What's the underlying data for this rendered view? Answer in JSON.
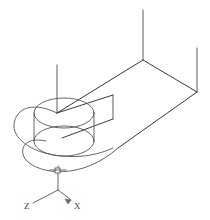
{
  "drawing": {
    "title": "Isometric Wireframe Part",
    "background_color": "#ffffff",
    "line_color": "#4a4a4a",
    "view": "isometric",
    "description": "3D isometric wireframe of a flat plate with a rounded end containing a through hole, with vertical construction lines"
  },
  "axis_indicator": {
    "name": "coordinate-axes",
    "origin": {
      "x": 58,
      "y": 190
    },
    "axes": [
      {
        "id": "z",
        "label": "Z",
        "label_x": 30,
        "label_y": 207,
        "tip_x": 33,
        "tip_y": 202,
        "has_arrow": false
      },
      {
        "id": "x",
        "label": "X",
        "label_x": 76,
        "label_y": 208,
        "tip_x": 73,
        "tip_y": 201,
        "has_arrow": true
      },
      {
        "id": "y",
        "label": "",
        "label_x": 58,
        "label_y": 160,
        "tip_x": 58,
        "tip_y": 168,
        "has_arrow": false
      }
    ]
  },
  "geometry": {
    "top_face": {
      "name": "top-face-outline",
      "points": "143,60 196,92 118,148 57,113"
    },
    "vertical_lines": [
      {
        "name": "vline-rear-apex",
        "x1": 143,
        "y1": 10,
        "x2": 143,
        "y2": 60
      },
      {
        "name": "vline-right",
        "x1": 197,
        "y1": 48,
        "x2": 197,
        "y2": 92
      },
      {
        "name": "vline-left",
        "x1": 57,
        "y1": 65,
        "x2": 57,
        "y2": 113
      },
      {
        "name": "vline-inner",
        "x1": 113,
        "y1": 95,
        "x2": 113,
        "y2": 119
      }
    ],
    "hole": {
      "name": "through-hole",
      "top_ellipse": {
        "cx": 64,
        "cy": 113,
        "rx": 30,
        "ry": 15
      },
      "bottom_ellipse": {
        "cx": 64,
        "cy": 141,
        "rx": 30,
        "ry": 15
      }
    },
    "rounded_end": {
      "name": "rounded-end-contour",
      "top_arc": "M 57,113 C 20,96 12,120 16,133 C 20,147 44,160 72,157",
      "bottom_arc": "M 44,148 C 22,140 20,152 30,161 C 44,173 76,176 100,168"
    }
  },
  "labels": {
    "z": "Z",
    "x": "X"
  }
}
